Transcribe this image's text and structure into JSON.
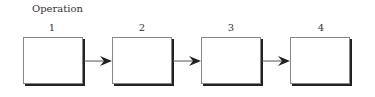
{
  "diagram": {
    "title": "Operation",
    "steps": [
      {
        "label": "1"
      },
      {
        "label": "2"
      },
      {
        "label": "3"
      },
      {
        "label": "4"
      }
    ]
  }
}
